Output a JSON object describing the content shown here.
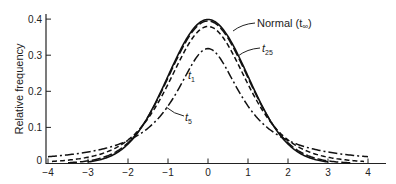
{
  "chart_data": {
    "type": "line",
    "title": "",
    "xlabel": "",
    "ylabel": "Relative frequency",
    "xlim": [
      -4,
      4
    ],
    "ylim": [
      0,
      0.4
    ],
    "grid": false,
    "legend": "inline annotations",
    "x_ticks": [
      "-4",
      "-3",
      "-2",
      "-1",
      "0",
      "1",
      "2",
      "3",
      "4"
    ],
    "y_ticks": [
      "0",
      "0.1",
      "0.2",
      "0.3",
      "0.4"
    ],
    "x": [
      -4,
      -3,
      -2,
      -1,
      0,
      1,
      2,
      3,
      4
    ],
    "series": [
      {
        "name": "Normal (t∞)",
        "style": "solid",
        "values": [
          0.0001,
          0.0044,
          0.054,
          0.242,
          0.399,
          0.242,
          0.054,
          0.0044,
          0.0001
        ]
      },
      {
        "name": "t25",
        "style": "long-dash",
        "values": [
          0.0009,
          0.0068,
          0.058,
          0.237,
          0.394,
          0.237,
          0.058,
          0.0068,
          0.0009
        ]
      },
      {
        "name": "t5",
        "style": "short-dash",
        "values": [
          0.0051,
          0.0173,
          0.065,
          0.22,
          0.38,
          0.22,
          0.065,
          0.0173,
          0.0051
        ]
      },
      {
        "name": "t1",
        "style": "dash-dot",
        "values": [
          0.0187,
          0.0318,
          0.064,
          0.159,
          0.318,
          0.159,
          0.064,
          0.0318,
          0.0187
        ]
      }
    ],
    "annotations": [
      {
        "text": "Normal (t",
        "sub": "∞",
        "suffix": ")"
      },
      {
        "text": "t",
        "sub": "25"
      },
      {
        "text": "t",
        "sub": "1"
      },
      {
        "text": "t",
        "sub": "5"
      }
    ]
  }
}
